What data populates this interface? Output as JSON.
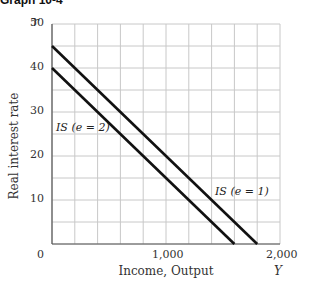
{
  "title": "Graph 10-4",
  "chart_data": {
    "type": "line",
    "title": "Graph 10-4",
    "xlabel": "Income, Output",
    "ylabel": "Real interest rate",
    "x_symbol": "Y",
    "y_symbol": "r",
    "xlim": [
      0,
      2000
    ],
    "ylim": [
      0,
      50
    ],
    "x_ticks": [
      "0",
      "1,000",
      "2,000"
    ],
    "y_ticks": [
      "10",
      "20",
      "30",
      "40",
      "50"
    ],
    "grid": true,
    "grid_x_step": 200,
    "grid_y_step": 5,
    "series": [
      {
        "name": "IS (e = 1)",
        "x": [
          0,
          1800
        ],
        "y": [
          45,
          0
        ]
      },
      {
        "name": "IS (e = 2)",
        "x": [
          0,
          1600
        ],
        "y": [
          40,
          0
        ]
      }
    ]
  },
  "labels": {
    "is_e1": "IS (e = 1)",
    "is_e2": "IS (e = 2)"
  }
}
